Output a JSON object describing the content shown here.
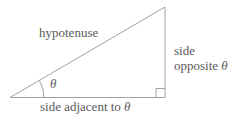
{
  "figure": {
    "labels": {
      "hypotenuse": "hypotenuse",
      "angle_theta": "θ",
      "opposite_line1": "side",
      "opposite_line2_prefix": "opposite ",
      "opposite_theta": "θ",
      "adjacent_prefix": "side adjacent to ",
      "adjacent_theta": "θ"
    },
    "colors": {
      "line": "#a0a0a0",
      "text": "#5a5a5a",
      "background": "#ffffff"
    }
  }
}
